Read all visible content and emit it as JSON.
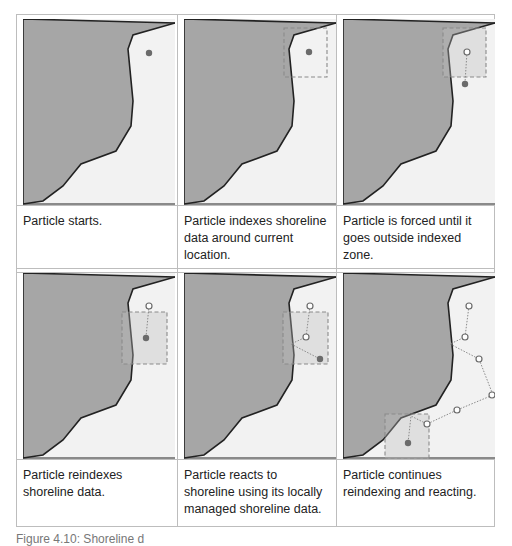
{
  "figure": {
    "caption": "Figure 4.10: Shoreline d",
    "colors": {
      "land": "#a6a6a6",
      "water": "#f2f2f2",
      "coastline": "#222222",
      "index_box": "#8a8a8a",
      "particle_current": "#6b6b6b",
      "particle_past": "#ffffff",
      "border": "#bdbdbd"
    },
    "panels": [
      {
        "id": 1,
        "caption": "Particle starts.",
        "state": "particle-at-start"
      },
      {
        "id": 2,
        "caption": "Particle indexes shoreline data around current location.",
        "state": "index-box-drawn"
      },
      {
        "id": 3,
        "caption": "Particle is forced until it goes outside indexed zone.",
        "state": "particle-exits-zone"
      },
      {
        "id": 4,
        "caption": "Particle reindexes shoreline data.",
        "state": "new-index-box"
      },
      {
        "id": 5,
        "caption": "Particle reacts to shoreline using its locally managed shoreline data.",
        "state": "particle-reflects"
      },
      {
        "id": 6,
        "caption": "Particle continues reindexing and reacting.",
        "state": "trajectory-continues"
      }
    ]
  }
}
